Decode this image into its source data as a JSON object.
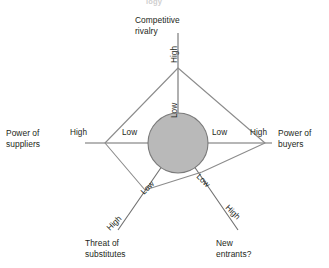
{
  "figure": {
    "title_partial": "logy",
    "background_color": "#ffffff",
    "line_color": "#6f6f6f",
    "polygon_color": "#8c8c8c",
    "circle_fill": "#b9b9b9",
    "circle_stroke": "#7a7a7a",
    "text_color": "#231f20"
  },
  "axes": [
    {
      "id": "competitive-rivalry",
      "name": "Competitive\nrivalry",
      "low_label": "Low",
      "high_label": "High",
      "direction": "up"
    },
    {
      "id": "power-of-suppliers",
      "name": "Power of\nsuppliers",
      "low_label": "Low",
      "high_label": "High",
      "direction": "left"
    },
    {
      "id": "power-of-buyers",
      "name": "Power of\nbuyers",
      "low_label": "Low",
      "high_label": "High",
      "direction": "right"
    },
    {
      "id": "threat-of-substitutes",
      "name": "Threat of\nsubstitutes",
      "low_label": "Low",
      "high_label": "High",
      "direction": "lower-left"
    },
    {
      "id": "new-entrants",
      "name": "New\nentrants?",
      "low_label": "Low",
      "high_label": "High",
      "direction": "lower-right"
    }
  ],
  "chart_data": {
    "type": "radar",
    "title": "logy",
    "categories": [
      "Competitive rivalry",
      "Power of buyers",
      "New entrants?",
      "Threat of substitutes",
      "Power of suppliers"
    ],
    "scale_min_label": "Low",
    "scale_max_label": "High",
    "values": [
      0.92,
      0.78,
      0.3,
      0.52,
      0.7
    ],
    "vertices_px": [
      {
        "category": "Competitive rivalry",
        "x": 178,
        "y": 68
      },
      {
        "category": "Power of buyers",
        "x": 265,
        "y": 143
      },
      {
        "category": "New entrants?",
        "x": 202,
        "y": 172
      },
      {
        "category": "Threat of substitutes",
        "x": 145,
        "y": 190
      },
      {
        "category": "Power of suppliers",
        "x": 105,
        "y": 143
      }
    ],
    "center_px": {
      "x": 178,
      "y": 143
    },
    "center_circle_radius_px": 30,
    "grid": false,
    "legend": "none"
  }
}
